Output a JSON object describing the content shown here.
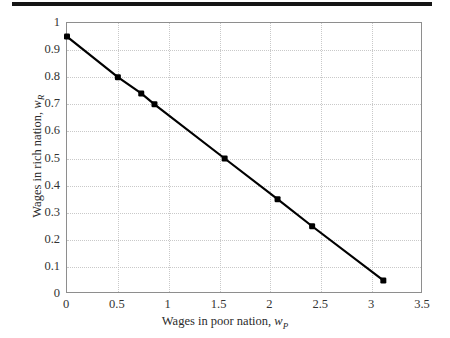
{
  "figure": {
    "background_color": "#ffffff",
    "scan_artifact_color": "#151515",
    "axis_color": "#8e8e8e",
    "grid_color": "#c9c9c9",
    "series_color": "#000000"
  },
  "chart_data": {
    "type": "line",
    "title": "",
    "xlabel": "Wages in poor nation, w_P",
    "xlabel_text": "Wages in poor nation, ",
    "xlabel_symbol": "w",
    "xlabel_subscript": "P",
    "ylabel": "Wages in rich nation, w_R",
    "ylabel_text": "Wages in rich nation, ",
    "ylabel_symbol": "w",
    "ylabel_subscript": "R",
    "xlim": [
      0,
      3.5
    ],
    "ylim": [
      0,
      1
    ],
    "xticks": [
      0,
      0.5,
      1,
      1.5,
      2,
      2.5,
      3,
      3.5
    ],
    "xtick_labels": [
      "0",
      "0.5",
      "1",
      "1.5",
      "2",
      "2.5",
      "3",
      "3.5"
    ],
    "yticks": [
      0,
      0.1,
      0.2,
      0.3,
      0.4,
      0.5,
      0.6,
      0.7,
      0.8,
      0.9,
      1
    ],
    "ytick_labels": [
      "0",
      "0.1",
      "0.2",
      "0.3",
      "0.4",
      "0.5",
      "0.6",
      "0.7",
      "0.8",
      "0.9",
      "1"
    ],
    "grid": true,
    "grid_style": "dotted",
    "legend": false,
    "legend_position": "none",
    "marker": "filled-square",
    "marker_size": 6,
    "line_width": 2,
    "x": [
      0,
      0.5,
      0.73,
      0.86,
      1.55,
      2.07,
      2.41,
      3.11
    ],
    "y": [
      0.95,
      0.8,
      0.74,
      0.7,
      0.5,
      0.35,
      0.25,
      0.05
    ],
    "points": [
      {
        "x": 0,
        "y": 0.95
      },
      {
        "x": 0.5,
        "y": 0.8
      },
      {
        "x": 0.73,
        "y": 0.74
      },
      {
        "x": 0.86,
        "y": 0.7
      },
      {
        "x": 1.55,
        "y": 0.5
      },
      {
        "x": 2.07,
        "y": 0.35
      },
      {
        "x": 2.41,
        "y": 0.25
      },
      {
        "x": 3.11,
        "y": 0.05
      }
    ],
    "series": [
      {
        "name": "wage frontier",
        "x": [
          0,
          0.5,
          0.73,
          0.86,
          1.55,
          2.07,
          2.41,
          3.11
        ],
        "values": [
          0.95,
          0.8,
          0.74,
          0.7,
          0.5,
          0.35,
          0.25,
          0.05
        ]
      }
    ]
  }
}
